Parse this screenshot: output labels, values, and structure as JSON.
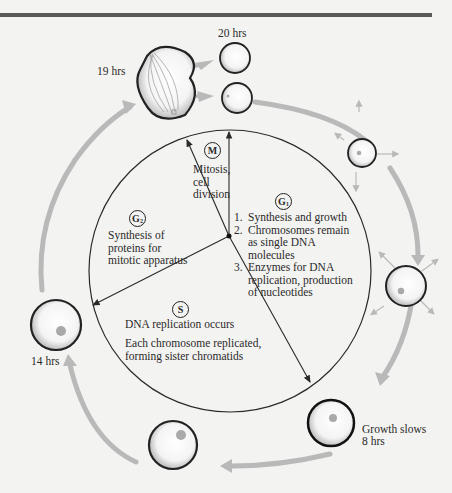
{
  "colors": {
    "background": "#f3f3f1",
    "top_rule": "#5a5a5a",
    "cycle_arrow": "#b9b9b9",
    "line": "#2a2a2a",
    "nucleus": "#a9a9a9"
  },
  "timepoints": {
    "t19": "19 hrs",
    "t20": "20 hrs",
    "t14": "14 hrs",
    "t8_note": "Growth slows",
    "t8": "8 hrs"
  },
  "phases": {
    "M": {
      "symbol": "M",
      "description_lines": [
        "Mitosis,",
        "cell",
        "division"
      ]
    },
    "G1": {
      "symbol": "G",
      "subscript": "1",
      "items": [
        {
          "num": "1.",
          "lines": [
            "Synthesis and growth"
          ]
        },
        {
          "num": "2.",
          "lines": [
            "Chromosomes remain",
            "as single DNA",
            "molecules"
          ]
        },
        {
          "num": "3.",
          "lines": [
            "Enzymes for DNA",
            "replication, production",
            "of nucleotides"
          ]
        }
      ]
    },
    "G2": {
      "symbol": "G",
      "subscript": "2",
      "description_lines": [
        "Synthesis of",
        "proteins for",
        "mitotic apparatus"
      ]
    },
    "S": {
      "symbol": "S",
      "line1": "DNA replication occurs",
      "line2_lines": [
        "Each chromosome replicated,",
        "forming sister chromatids"
      ]
    }
  }
}
